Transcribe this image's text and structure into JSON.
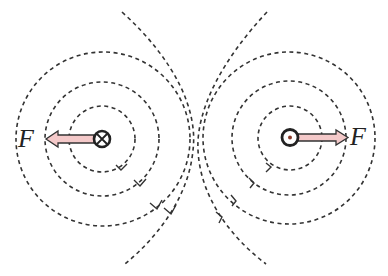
{
  "diagram": {
    "left_wire": {
      "symbol": "current-into-page",
      "force_label": "F",
      "force_direction": "left"
    },
    "right_wire": {
      "symbol": "current-out-of-page",
      "force_label": "F",
      "force_direction": "right"
    },
    "colors": {
      "line": "#333333",
      "arrow_fill": "#f4c9c9",
      "arrow_stroke": "#333333",
      "dot": "#8b3a2a"
    }
  }
}
